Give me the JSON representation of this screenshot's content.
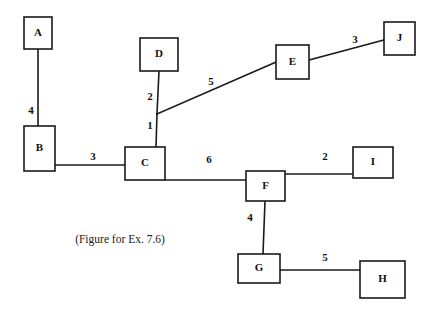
{
  "figure": {
    "caption": "(Figure for Ex. 7.6)",
    "caption_x": 120,
    "caption_y": 240,
    "background_color": "#ffffff",
    "stroke_color": "#1a1a1a",
    "width": 434,
    "height": 319
  },
  "graph": {
    "type": "weighted-undirected-graph",
    "nodes": [
      {
        "id": "A",
        "label": "A",
        "x": 24,
        "y": 17,
        "w": 28,
        "h": 32,
        "cx": 38,
        "cy": 33
      },
      {
        "id": "B",
        "label": "B",
        "x": 24,
        "y": 126,
        "w": 31,
        "h": 45,
        "cx": 39.5,
        "cy": 148.5
      },
      {
        "id": "C",
        "label": "C",
        "x": 125,
        "y": 147,
        "w": 40,
        "h": 33,
        "cx": 145,
        "cy": 163.5
      },
      {
        "id": "D",
        "label": "D",
        "x": 140,
        "y": 38,
        "w": 38,
        "h": 33,
        "cx": 159,
        "cy": 54.5
      },
      {
        "id": "E",
        "label": "E",
        "x": 276,
        "y": 45,
        "w": 33,
        "h": 34,
        "cx": 292.5,
        "cy": 62
      },
      {
        "id": "F",
        "label": "F",
        "x": 246,
        "y": 171,
        "w": 39,
        "h": 30,
        "cx": 265.5,
        "cy": 186
      },
      {
        "id": "G",
        "label": "G",
        "x": 238,
        "y": 254,
        "w": 42,
        "h": 29,
        "cx": 259,
        "cy": 268.5
      },
      {
        "id": "H",
        "label": "H",
        "x": 360,
        "y": 261,
        "w": 45,
        "h": 37,
        "cx": 382.5,
        "cy": 279.5
      },
      {
        "id": "I",
        "label": "I",
        "x": 353,
        "y": 147,
        "w": 40,
        "h": 31,
        "cx": 373,
        "cy": 162.5
      },
      {
        "id": "J",
        "label": "J",
        "x": 384,
        "y": 22,
        "w": 31,
        "h": 33,
        "cx": 399.5,
        "cy": 38.5
      }
    ],
    "edges": [
      {
        "from": "A",
        "to": "B",
        "weight": "4",
        "x1": 38,
        "y1": 49,
        "x2": 38,
        "y2": 126,
        "lx": 31,
        "ly": 111
      },
      {
        "from": "B",
        "to": "C",
        "weight": "3",
        "x1": 55,
        "y1": 165,
        "x2": 125,
        "y2": 165,
        "lx": 93,
        "ly": 157
      },
      {
        "from": "D",
        "to": "C",
        "weight": "2",
        "x1": 159,
        "y1": 71,
        "x2": 157,
        "y2": 114,
        "lx": 150,
        "ly": 97
      },
      {
        "from": "C",
        "to": "D",
        "weight": "1",
        "x1": 157,
        "y1": 114,
        "x2": 156,
        "y2": 147,
        "lx": 150,
        "ly": 126
      },
      {
        "from": "C",
        "to": "E",
        "weight": "5",
        "x1": 157,
        "y1": 114,
        "x2": 276,
        "y2": 62,
        "lx": 211,
        "ly": 82
      },
      {
        "from": "E",
        "to": "J",
        "weight": "3",
        "x1": 309,
        "y1": 60,
        "x2": 384,
        "y2": 40,
        "lx": 355,
        "ly": 40
      },
      {
        "from": "C",
        "to": "F",
        "weight": "6",
        "x1": 165,
        "y1": 180,
        "x2": 246,
        "y2": 180,
        "lx": 209,
        "ly": 160
      },
      {
        "from": "F",
        "to": "I",
        "weight": "2",
        "x1": 285,
        "y1": 174,
        "x2": 353,
        "y2": 174,
        "lx": 325,
        "ly": 157
      },
      {
        "from": "F",
        "to": "G",
        "weight": "4",
        "x1": 265,
        "y1": 201,
        "x2": 263,
        "y2": 254,
        "lx": 250,
        "ly": 218
      },
      {
        "from": "G",
        "to": "H",
        "weight": "5",
        "x1": 280,
        "y1": 270,
        "x2": 360,
        "y2": 270,
        "lx": 325,
        "ly": 258
      }
    ]
  }
}
